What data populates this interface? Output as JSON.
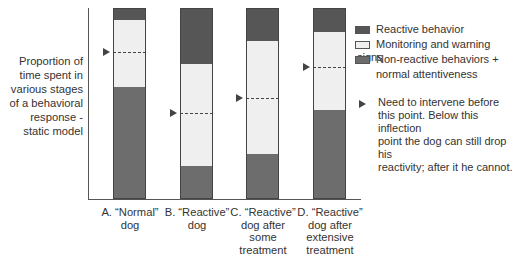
{
  "chart_data": {
    "type": "bar",
    "stacked": true,
    "title": "",
    "ylabel": "Proportion of time spent in various stages of a behavioral response - static model",
    "xlabel": "",
    "ylim": [
      0,
      100
    ],
    "grid": false,
    "legend_position": "right",
    "categories": [
      "A. “Normal” dog",
      "B. “Reactive” dog",
      "C. “Reactive” dog after some treatment",
      "D. “Reactive” dog after extensive treatment"
    ],
    "series": [
      {
        "name": "Non-reactive behaviors + normal attentiveness",
        "color": "#6d6d6d",
        "values": [
          59,
          18,
          24,
          47
        ]
      },
      {
        "name": "Monitoring and warning signs",
        "color": "#efefef",
        "values": [
          35,
          53,
          59,
          41
        ]
      },
      {
        "name": "Reactive behavior",
        "color": "#565656",
        "values": [
          6,
          29,
          17,
          12
        ]
      }
    ],
    "inflection_points": [
      77,
      45,
      53,
      69
    ],
    "annotation": "Need to intervene before this point. Below this inflection point the dog can still drop his reactivity; after it he cannot."
  },
  "ylabel_lines": [
    "Proportion of",
    "time spent in",
    "various stages",
    "of a behavioral",
    "response -",
    "static model"
  ],
  "xlabels": [
    [
      "A. “Normal”",
      "dog"
    ],
    [
      "B. “Reactive”",
      "dog"
    ],
    [
      "C. “Reactive”",
      "dog after",
      "some",
      "treatment"
    ],
    [
      "D. “Reactive”",
      "dog after",
      "extensive",
      "treatment"
    ]
  ],
  "legend": {
    "reactive": "Reactive behavior",
    "monitoring": "Monitoring and warning signs",
    "nonreactive_1": "Non-reactive behaviors +",
    "nonreactive_2": "normal attentiveness",
    "note_lines": [
      "Need to intervene before",
      "this point. Below this inflection",
      "point the dog can still drop his",
      "reactivity; after it he cannot."
    ]
  }
}
